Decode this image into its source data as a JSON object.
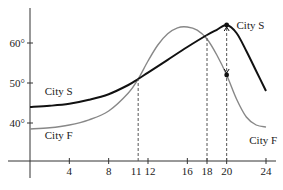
{
  "chart_data": {
    "type": "line",
    "title": "",
    "xlabel": "",
    "ylabel": "",
    "xlim": [
      0,
      24
    ],
    "ylim": [
      30,
      68
    ],
    "grid": false,
    "x_ticks": [
      4,
      8,
      11,
      12,
      16,
      18,
      20,
      24
    ],
    "x_tick_labels": [
      "4",
      "8",
      "11",
      "12",
      "16",
      "18",
      "20",
      "24"
    ],
    "y_ticks": [
      40,
      50,
      60
    ],
    "y_tick_labels": [
      "40°",
      "50°",
      "60°"
    ],
    "series": [
      {
        "name": "City S",
        "color": "#111111",
        "x": [
          0,
          2,
          4,
          6,
          8,
          10,
          11,
          12,
          14,
          16,
          18,
          19,
          20,
          21,
          22,
          23,
          24
        ],
        "y": [
          44,
          44.3,
          44.8,
          45.8,
          47.2,
          49.5,
          51,
          52.6,
          55.8,
          59,
          62,
          63.3,
          64.5,
          62.5,
          58,
          53,
          48
        ]
      },
      {
        "name": "City F",
        "color": "#888888",
        "x": [
          0,
          2,
          4,
          6,
          8,
          10,
          11,
          12,
          13,
          14,
          15,
          16,
          17,
          18,
          19,
          20,
          21,
          22,
          23,
          24
        ],
        "y": [
          38.5,
          38.8,
          39.5,
          40.8,
          43,
          47.5,
          51,
          55.5,
          59.5,
          62.3,
          63.8,
          64,
          63.2,
          61,
          57,
          52,
          46,
          41.5,
          39.5,
          39
        ]
      }
    ],
    "annotations": [
      {
        "type": "dashed-vline",
        "x": 11,
        "from": 30,
        "to": 51
      },
      {
        "type": "dashed-vline",
        "x": 18,
        "from": 30,
        "to": 62
      },
      {
        "type": "dashed-vline",
        "x": 20,
        "from": 30,
        "to": 64.5
      },
      {
        "type": "point",
        "x": 20,
        "y": 64.5,
        "series": "City S"
      },
      {
        "type": "point",
        "x": 20,
        "y": 52,
        "series": "City F"
      },
      {
        "type": "double-arrow",
        "x": 20,
        "from": 52,
        "to": 64.5
      }
    ],
    "curve_labels": [
      {
        "text": "City S",
        "x": 1.5,
        "y": 47,
        "series": "City S"
      },
      {
        "text": "City F",
        "x": 1.5,
        "y": 36,
        "series": "City F"
      },
      {
        "text": "City S",
        "x": 21,
        "y": 63.5,
        "series": "City S"
      },
      {
        "text": "City F",
        "x": 22.3,
        "y": 34.8,
        "series": "City F"
      }
    ],
    "legend": "none (inline curve labels)"
  }
}
